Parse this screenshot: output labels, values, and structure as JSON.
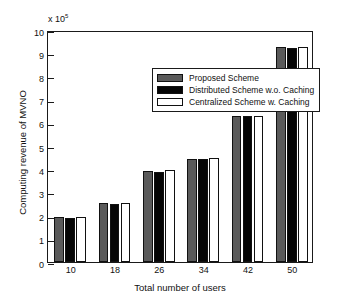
{
  "chart_data": {
    "type": "bar",
    "title": "",
    "xlabel": "Total number of users",
    "ylabel": "Computing revenue of MVNO",
    "y_exponent_label": "x 10",
    "y_exponent_power": "5",
    "categories": [
      "10",
      "18",
      "26",
      "34",
      "42",
      "50"
    ],
    "series": [
      {
        "name": "Proposed Scheme",
        "color": "#5a5a5a",
        "values": [
          1.93,
          2.53,
          3.93,
          4.46,
          6.3,
          9.25
        ]
      },
      {
        "name": "Distributed Scheme w.o. Caching",
        "color": "#050505",
        "values": [
          1.91,
          2.51,
          3.9,
          4.44,
          6.29,
          9.24
        ]
      },
      {
        "name": "Centralized Scheme w. Caching",
        "color": "#ffffff",
        "values": [
          1.92,
          2.53,
          3.96,
          4.48,
          6.31,
          9.26
        ]
      }
    ],
    "ylim": [
      0,
      10
    ],
    "yticks": [
      "0",
      "1",
      "2",
      "3",
      "4",
      "5",
      "6",
      "7",
      "8",
      "9",
      "10"
    ],
    "xticks": [
      "10",
      "18",
      "26",
      "34",
      "42",
      "50"
    ],
    "grid": false,
    "legend_position": "top-center",
    "legend": [
      "Proposed Scheme",
      "Distributed Scheme w.o. Caching",
      "Centralized Scheme w. Caching"
    ]
  }
}
